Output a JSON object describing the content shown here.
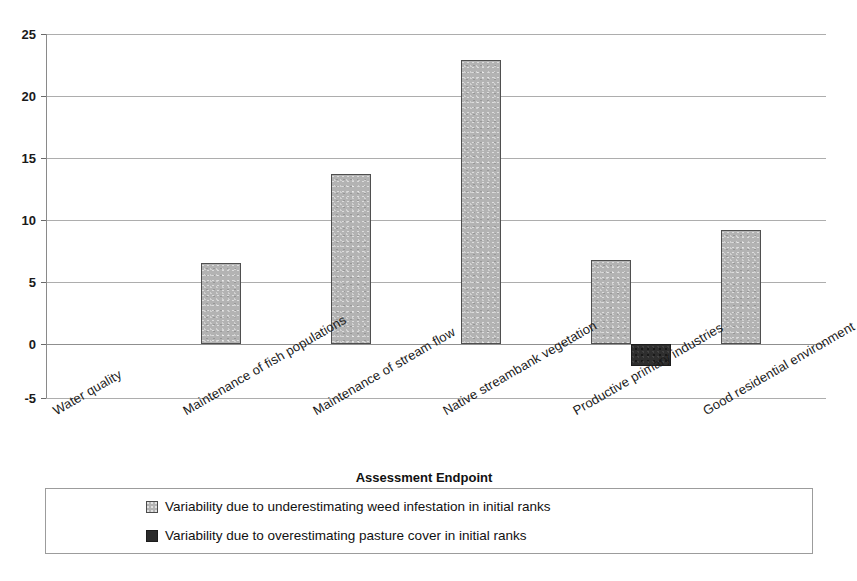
{
  "chart_data": {
    "type": "bar",
    "title": "",
    "xlabel": "Assessment Endpoint",
    "ylabel": "",
    "ylim": [
      -5,
      25
    ],
    "yticks": [
      25,
      20,
      15,
      10,
      5,
      0,
      -5
    ],
    "grid": true,
    "legend_position": "bottom",
    "categories": [
      "Water quality",
      "Maintenance of fish populations",
      "Maintenance of stream flow",
      "Native streambank vegetation",
      "Productive primary industries",
      "Good residential environment"
    ],
    "series": [
      {
        "name": "Variability due to underestimating weed infestation in initial ranks",
        "color": "#b3b3b3",
        "values": [
          0,
          6.5,
          13.7,
          22.9,
          6.8,
          9.2
        ]
      },
      {
        "name": "Variability due to overestimating pasture cover in initial ranks",
        "color": "#2b2b2b",
        "values": [
          0,
          0,
          0,
          0,
          -1.8,
          0
        ]
      }
    ]
  },
  "legend": {
    "items": [
      {
        "label": "Variability due to underestimating weed infestation in initial ranks",
        "swatch": "light-gray-swatch"
      },
      {
        "label": "Variability due to overestimating pasture cover in initial ranks",
        "swatch": "dark-swatch"
      }
    ]
  },
  "axis": {
    "x_title": "Assessment Endpoint",
    "y_tick_labels": [
      "25",
      "20",
      "15",
      "10",
      "5",
      "0",
      "-5"
    ]
  }
}
